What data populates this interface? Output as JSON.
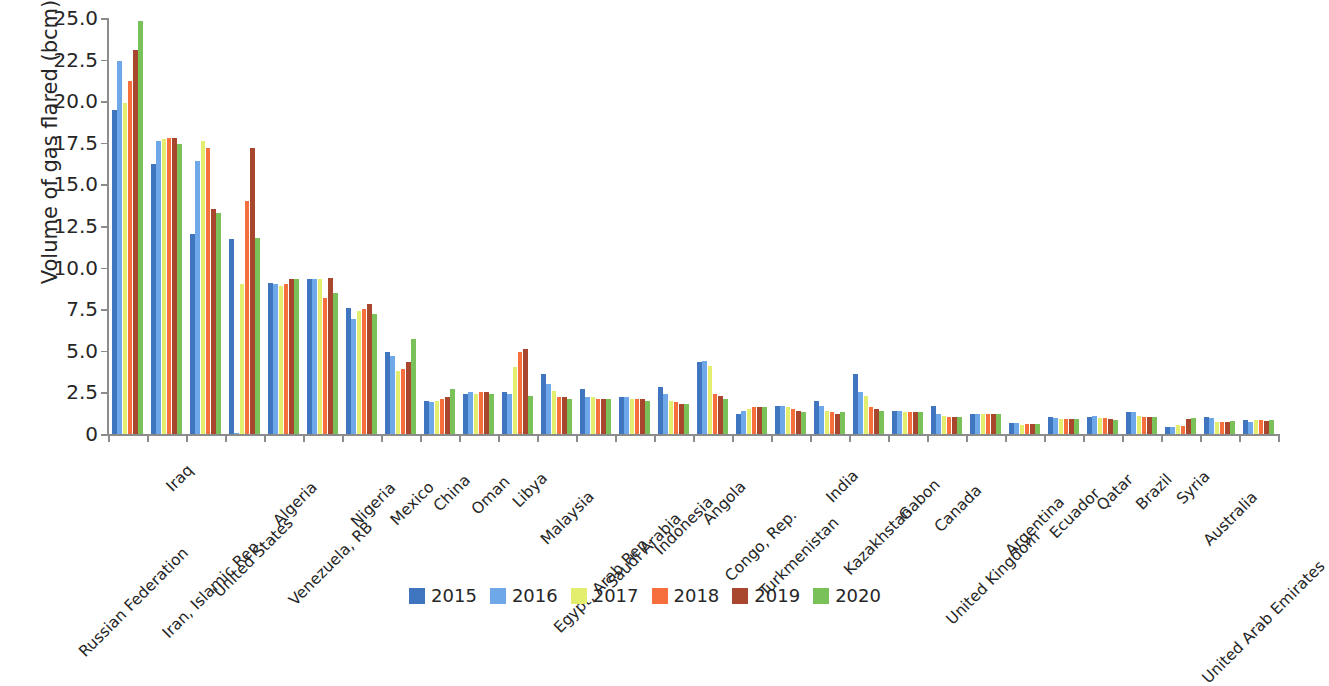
{
  "chart_data": {
    "type": "bar",
    "title": "",
    "subtitle": "",
    "xlabel": "",
    "ylabel": "Volume of gas flared (bcm)",
    "ylim": [
      0,
      25
    ],
    "y_ticks": [
      "0",
      "2.5",
      "5.0",
      "7.5",
      "10.0",
      "12.5",
      "15.0",
      "17.5",
      "20.0",
      "22.5",
      "25.0"
    ],
    "y_tick_values": [
      0,
      2.5,
      5.0,
      7.5,
      10.0,
      12.5,
      15.0,
      17.5,
      20.0,
      22.5,
      25.0
    ],
    "grid": false,
    "legend_position": "bottom",
    "categories": [
      "Russian Federation",
      "Iraq",
      "Iran, Islamic Rep.",
      "United States",
      "Algeria",
      "Venezuela, RB",
      "Nigeria",
      "Mexico",
      "China",
      "Oman",
      "Libya",
      "Malaysia",
      "Egypt, Arab Rep.",
      "Saudi Arabia",
      "Indonesia",
      "Angola",
      "Congo, Rep.",
      "Turkmenistan",
      "India",
      "Kazakhstan",
      "Gabon",
      "Canada",
      "United Kingdom",
      "Argentina",
      "Ecuador",
      "Qatar",
      "Brazil",
      "Syria",
      "Australia",
      "United Arab Emirates"
    ],
    "series": [
      {
        "name": "2015",
        "color": "#3f76bf",
        "values": [
          19.5,
          16.2,
          12.0,
          11.7,
          9.1,
          9.3,
          7.6,
          4.9,
          2.0,
          2.4,
          2.5,
          3.6,
          2.7,
          2.2,
          2.8,
          4.3,
          1.2,
          1.7,
          2.0,
          3.6,
          1.4,
          1.7,
          1.2,
          0.65,
          1.0,
          1.0,
          1.3,
          0.45,
          1.0,
          0.85
        ]
      },
      {
        "name": "2016",
        "color": "#6fa8e8",
        "values": [
          22.4,
          17.6,
          16.4,
          0.05,
          9.0,
          9.3,
          6.9,
          4.7,
          1.9,
          2.5,
          2.4,
          3.0,
          2.2,
          2.2,
          2.4,
          4.4,
          1.4,
          1.7,
          1.7,
          2.5,
          1.4,
          1.2,
          1.2,
          0.65,
          0.95,
          1.1,
          1.3,
          0.4,
          0.95,
          0.7
        ]
      },
      {
        "name": "2017",
        "color": "#e3ee6e",
        "values": [
          19.9,
          17.7,
          17.6,
          9.0,
          8.9,
          9.3,
          7.4,
          3.8,
          2.0,
          2.4,
          4.0,
          2.6,
          2.2,
          2.1,
          2.0,
          4.1,
          1.5,
          1.6,
          1.4,
          2.3,
          1.3,
          1.1,
          1.2,
          0.55,
          0.9,
          0.95,
          1.1,
          0.55,
          0.75,
          0.85
        ]
      },
      {
        "name": "2018",
        "color": "#f5703c",
        "values": [
          21.2,
          17.8,
          17.2,
          14.0,
          9.0,
          8.2,
          7.5,
          3.9,
          2.1,
          2.5,
          4.9,
          2.2,
          2.1,
          2.1,
          1.9,
          2.4,
          1.6,
          1.5,
          1.3,
          1.6,
          1.3,
          1.0,
          1.2,
          0.6,
          0.9,
          0.95,
          1.0,
          0.5,
          0.75,
          0.85
        ]
      },
      {
        "name": "2019",
        "color": "#a8462e",
        "values": [
          23.1,
          17.8,
          13.5,
          17.2,
          9.3,
          9.4,
          7.8,
          4.3,
          2.2,
          2.5,
          5.1,
          2.2,
          2.1,
          2.1,
          1.8,
          2.3,
          1.6,
          1.4,
          1.2,
          1.5,
          1.3,
          1.0,
          1.2,
          0.6,
          0.9,
          0.9,
          1.0,
          0.9,
          0.75,
          0.8
        ]
      },
      {
        "name": "2020",
        "color": "#7ac15a",
        "values": [
          24.8,
          17.4,
          13.3,
          11.8,
          9.3,
          8.5,
          7.2,
          5.7,
          2.7,
          2.4,
          2.3,
          2.1,
          2.1,
          2.0,
          1.8,
          2.1,
          1.6,
          1.3,
          1.3,
          1.4,
          1.3,
          1.0,
          1.2,
          0.6,
          0.9,
          0.85,
          1.0,
          0.95,
          0.8,
          0.85
        ]
      }
    ]
  },
  "legend": {
    "entries": [
      {
        "label": "2015",
        "color": "#3f76bf"
      },
      {
        "label": "2016",
        "color": "#6fa8e8"
      },
      {
        "label": "2017",
        "color": "#e3ee6e"
      },
      {
        "label": "2018",
        "color": "#f5703c"
      },
      {
        "label": "2019",
        "color": "#a8462e"
      },
      {
        "label": "2020",
        "color": "#7ac15a"
      }
    ]
  }
}
